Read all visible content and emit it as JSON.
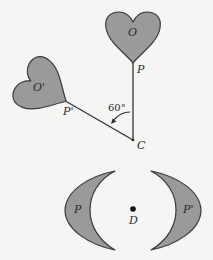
{
  "figure": {
    "colors": {
      "background": "#f5f5f4",
      "fill": "#9a9a9a",
      "stroke": "#3a3a3a"
    },
    "rotation": {
      "center_label": "C",
      "angle_label": "60°",
      "original": {
        "shape": "heart",
        "center_label": "O",
        "tip_label": "P"
      },
      "image": {
        "shape": "heart",
        "center_label": "O'",
        "tip_label": "P'"
      }
    },
    "symmetry": {
      "center_label": "D",
      "left": {
        "shape": "crescent",
        "label": "P"
      },
      "right": {
        "shape": "crescent",
        "label": "P'"
      }
    }
  }
}
